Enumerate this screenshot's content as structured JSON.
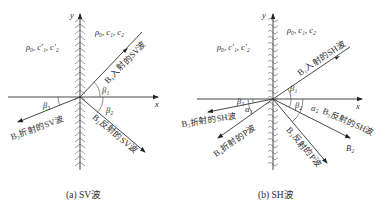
{
  "panel_a": {
    "caption": "(a) SV波",
    "axis_x": "x",
    "axis_y": "y",
    "medium_left": "ρ₀, c′₁, c′₂",
    "medium_right": "ρ₀, c₁, c₂",
    "incident": "B₁入射的SV波",
    "refracted": "B₃折射的SV波",
    "reflected": "B₂反射的SV波",
    "angle_incident": "β₁",
    "angle_reflected": "β₂",
    "angle_refracted": "β₃"
  },
  "panel_b": {
    "caption": "(b) SH波",
    "axis_x": "x",
    "axis_y": "y",
    "medium_left": "ρ₀, c′₁, c′₂",
    "medium_right": "ρ₀, c₁, c₂",
    "incident": "B₁入射的SH波",
    "refracted_sh": "B₃折射的SH波",
    "refracted_p": "B₄折射的P波",
    "reflected_sh": "B₂反射的SH波",
    "reflected_p": "B₃反射的P波",
    "b2_label": "B₂",
    "angle_incident": "β₁",
    "angle_reflected": "β₂",
    "angle_refracted": "β₃",
    "angle_alpha_left": "α₁",
    "angle_alpha_right": "α₂"
  }
}
